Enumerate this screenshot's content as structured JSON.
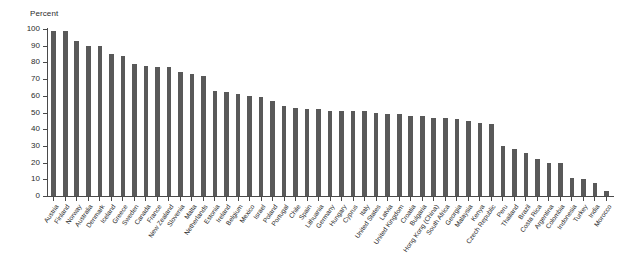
{
  "chart_data": {
    "type": "bar",
    "title": "",
    "ylabel": "Percent",
    "xlabel": "",
    "ylim": [
      0,
      100
    ],
    "yticks": [
      0,
      10,
      20,
      30,
      40,
      50,
      60,
      70,
      80,
      90,
      100
    ],
    "grid": false,
    "legend": "none",
    "bar_color": "#595959",
    "categories": [
      "Austria",
      "Finland",
      "Norway",
      "Australia",
      "Denmark",
      "Iceland",
      "Greece",
      "Sweden",
      "Canada",
      "France",
      "New Zealand",
      "Slovenia",
      "Malta",
      "Netherlands",
      "Estonia",
      "Ireland",
      "Belgium",
      "Mexico",
      "Israel",
      "Poland",
      "Portugal",
      "Chile",
      "Spain",
      "Lithuania",
      "Germany",
      "Hungary",
      "Cyprus",
      "Italy",
      "United States",
      "Latvia",
      "United Kingdom",
      "Croatia",
      "Bulgaria",
      "Hong Kong (China)",
      "South Africa",
      "Georgia",
      "Malaysia",
      "Kenya",
      "Czech Republic",
      "Peru",
      "Thailand",
      "Brazil",
      "Costa Rica",
      "Argentina",
      "Colombia",
      "Indonesia",
      "Turkey",
      "India",
      "Morocco"
    ],
    "values": [
      99,
      99,
      93,
      90,
      90,
      85,
      84,
      79,
      78,
      77,
      77,
      74,
      73,
      72,
      63,
      62,
      61,
      60,
      59,
      57,
      54,
      53,
      52,
      52,
      51,
      51,
      51,
      51,
      50,
      49,
      49,
      48,
      48,
      47,
      47,
      46,
      45,
      44,
      43,
      30,
      28,
      26,
      22,
      20,
      20,
      11,
      10,
      8,
      3
    ]
  },
  "axis": {
    "y_title": "Percent"
  }
}
